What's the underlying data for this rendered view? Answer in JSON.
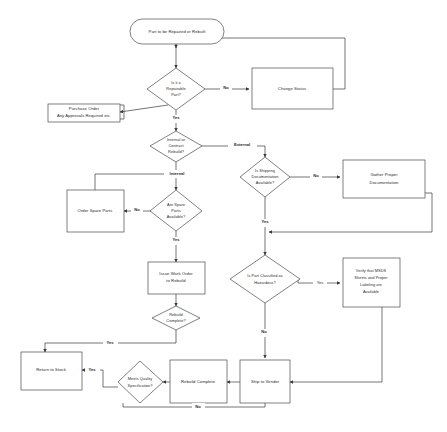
{
  "diagram": {
    "nodes": {
      "start": {
        "label": "Part to be  Repaired or Rebuilt",
        "shape": "terminator"
      },
      "repairable": {
        "label_line1": "Is it  a",
        "label_line2": "Repairable",
        "label_line3": "Part?",
        "shape": "decision"
      },
      "change_status": {
        "label": "Change Status",
        "shape": "process"
      },
      "purchase_order": {
        "label_line1": "Purchase Order",
        "label_line2": "Any Approvals Required etc.",
        "shape": "process"
      },
      "internal_or_contract": {
        "label_line1": "Internal or",
        "label_line2": "Contract",
        "label_line3": "Rebuild?",
        "shape": "decision"
      },
      "shipping_docs": {
        "label_line1": "Is Shipping",
        "label_line2": "Documentation",
        "label_line3": "Available?",
        "shape": "decision"
      },
      "gather_docs": {
        "label_line1": "Gather Proper",
        "label_line2": "Documentation",
        "shape": "process"
      },
      "spare_parts": {
        "label_line1": "Are Spare",
        "label_line2": "Parts",
        "label_line3": "Available?",
        "shape": "decision"
      },
      "order_spare_parts": {
        "label": "Order Spare Parts",
        "shape": "process"
      },
      "issue_work_order": {
        "label_line1": "Issue Work Order",
        "label_line2": "to Rebuild",
        "shape": "process"
      },
      "rebuild_complete_q": {
        "label_line1": "Rebuild",
        "label_line2": "Complete?",
        "shape": "decision"
      },
      "hazardous": {
        "label_line1": "Is Part Classified as",
        "label_line2": "Hazardous?",
        "shape": "decision"
      },
      "verify_msds": {
        "label_line1": "Verify that MSDS",
        "label_line2": "Sheets and Proper",
        "label_line3": "Labeling are",
        "label_line4": "Available",
        "shape": "process"
      },
      "return_to_stock": {
        "label": "Return to Stock",
        "shape": "process"
      },
      "meets_quality": {
        "label_line1": "Meets Quality",
        "label_line2": "Specification?",
        "shape": "decision"
      },
      "rebuild_complete_box": {
        "label": "Rebuild Complete",
        "shape": "process"
      },
      "ship_to_vendor": {
        "label": "Ship to Vendor",
        "shape": "process"
      }
    },
    "edge_labels": {
      "repairable_no": "No",
      "repairable_yes": "Yes",
      "branch_external": "External",
      "branch_internal": "Internal",
      "shipping_no": "No",
      "shipping_yes": "Yes",
      "spare_no": "No",
      "spare_yes": "Yes",
      "hazardous_yes": "Yes",
      "hazardous_no": "No",
      "rebuild_yes": "Yes",
      "quality_yes": "Yes",
      "quality_no": "No"
    },
    "colors": {
      "shape_stroke": "#4a4a4a",
      "connector_stroke": "#3a3a3a",
      "text": "#2b2b2b",
      "background": "#ffffff"
    }
  }
}
